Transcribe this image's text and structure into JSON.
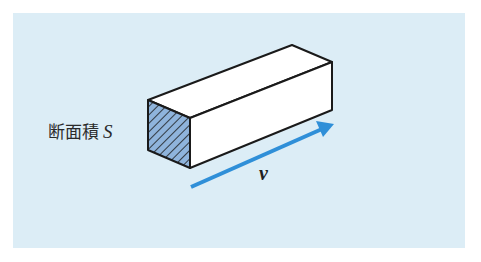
{
  "diagram": {
    "cross_section_label": "断面積",
    "cross_section_symbol": "S",
    "velocity_symbol": "v",
    "colors": {
      "background": "#dcedf6",
      "arrow": "#2f8fd8",
      "hatch_fill": "#8fb4dc",
      "outline": "#1a1a1a",
      "box_face": "#ffffff"
    }
  }
}
